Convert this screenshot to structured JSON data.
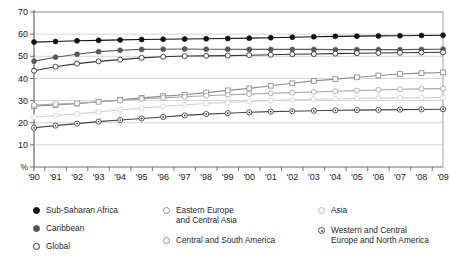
{
  "chart_data": {
    "type": "line",
    "title": "",
    "xlabel": "",
    "ylabel": "%",
    "ylim": [
      0,
      70
    ],
    "yticks": [
      0,
      10,
      20,
      30,
      40,
      50,
      60,
      70
    ],
    "ytick_labels": [
      "%",
      "10",
      "20",
      "30",
      "40",
      "50",
      "60",
      "70"
    ],
    "grid": true,
    "legend_position": "bottom",
    "x": [
      "'90",
      "'91",
      "'92",
      "'93",
      "'94",
      "'95",
      "'96",
      "'97",
      "'98",
      "'99",
      "'00",
      "'01",
      "'02",
      "'03",
      "'04",
      "'05",
      "'06",
      "'07",
      "'08",
      "'09"
    ],
    "series": [
      {
        "name": "Sub-Saharan Africa",
        "marker": "filled-circle-dark",
        "color": "#111111",
        "values": [
          56.4,
          56.7,
          57.0,
          57.2,
          57.4,
          57.6,
          57.7,
          57.8,
          57.9,
          58.0,
          58.2,
          58.4,
          58.6,
          58.8,
          59.0,
          59.1,
          59.2,
          59.3,
          59.4,
          59.5
        ]
      },
      {
        "name": "Caribbean",
        "marker": "filled-circle-mid",
        "color": "#595959",
        "values": [
          47.8,
          49.6,
          50.9,
          52.1,
          52.7,
          53.1,
          53.2,
          53.3,
          53.2,
          53.2,
          53.1,
          53.1,
          53.1,
          53.1,
          53.0,
          53.0,
          53.0,
          53.0,
          53.1,
          53.2
        ]
      },
      {
        "name": "Global",
        "marker": "open-circle-dark",
        "color": "#333333",
        "values": [
          43.5,
          45.3,
          46.7,
          47.7,
          48.5,
          49.3,
          49.8,
          50.1,
          50.2,
          50.3,
          50.5,
          50.7,
          50.9,
          51.0,
          51.2,
          51.4,
          51.5,
          51.6,
          51.7,
          51.8
        ]
      },
      {
        "name": "Eastern Europe and Central Asia",
        "marker": "open-square",
        "color": "#8f8f8f",
        "values": [
          27.5,
          28.0,
          28.6,
          29.5,
          30.4,
          31.2,
          32.0,
          32.6,
          33.6,
          34.6,
          35.5,
          36.7,
          37.8,
          38.9,
          39.7,
          40.5,
          41.3,
          42.0,
          42.4,
          42.7
        ]
      },
      {
        "name": "Central and South America",
        "marker": "open-circle-mid",
        "color": "#a8a8a8",
        "values": [
          28.0,
          28.4,
          28.8,
          29.4,
          30.1,
          30.7,
          31.2,
          31.7,
          32.2,
          32.6,
          32.9,
          33.3,
          33.6,
          33.9,
          34.2,
          34.5,
          34.8,
          35.1,
          35.3,
          35.4
        ]
      },
      {
        "name": "Asia",
        "marker": "open-circle-light",
        "color": "#d2d2d2",
        "values": [
          22.5,
          23.2,
          24.0,
          24.9,
          25.8,
          26.6,
          27.4,
          28.1,
          28.7,
          29.2,
          29.6,
          30.0,
          30.3,
          30.6,
          30.8,
          31.0,
          31.1,
          31.2,
          31.3,
          31.4
        ]
      },
      {
        "name": "Western and Central Europe and North America",
        "marker": "dotted-circle",
        "color": "#444444",
        "values": [
          17.7,
          18.7,
          19.6,
          20.5,
          21.2,
          21.9,
          22.6,
          23.3,
          23.9,
          24.3,
          24.7,
          25.0,
          25.2,
          25.4,
          25.6,
          25.7,
          25.8,
          25.9,
          26.0,
          26.1
        ]
      }
    ]
  },
  "legend": {
    "columns": [
      {
        "items": [
          {
            "label": "Sub-Saharan Africa",
            "marker": "filled-dark"
          },
          {
            "label": "Caribbean",
            "marker": "filled-mid"
          },
          {
            "label": "Global",
            "marker": "open-dark"
          }
        ]
      },
      {
        "items": [
          {
            "label": "Eastern Europe\nand Central Asia",
            "marker": "open-mid"
          },
          {
            "label": "Central and South America",
            "marker": "open-mid"
          }
        ]
      },
      {
        "items": [
          {
            "label": "Asia",
            "marker": "open-light"
          },
          {
            "label": "Western and Central\nEurope and North America",
            "marker": "dotted"
          }
        ]
      }
    ]
  }
}
